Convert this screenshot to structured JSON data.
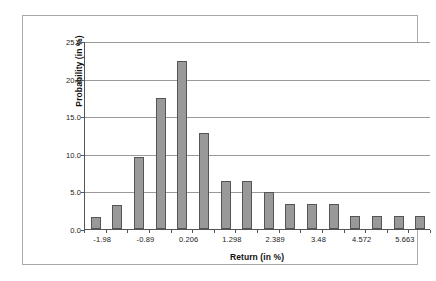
{
  "chart_data": {
    "type": "bar",
    "title": "",
    "subtitle": "",
    "xlabel": "Return (in %)",
    "ylabel": "Probability (in %)",
    "ylim": [
      0.0,
      25.0
    ],
    "y_ticks": [
      "0.0",
      "5.0",
      "10.0",
      "15.0",
      "20.0",
      "25.0"
    ],
    "y_tick_values": [
      0.0,
      5.0,
      10.0,
      15.0,
      20.0,
      25.0
    ],
    "grid": "horizontal",
    "legend": "none",
    "bar_color": "#999999",
    "bar_edge_color": "#555555",
    "gridline_color": "#9a9a9a",
    "axis_color": "#555555",
    "frame_color": "#a8a8a8",
    "bin_labels": [
      "-1.98",
      "-0.89",
      "0.206",
      "1.298",
      "2.389",
      "3.48",
      "4.572",
      "5.663"
    ],
    "bin_label_positions": [
      1,
      4,
      7,
      10,
      13,
      16,
      19,
      22
    ],
    "categories": [
      "-2.525",
      "-2.253",
      "-1.98",
      "-1.707",
      "-1.435",
      "-1.162",
      "-0.89",
      "-0.617",
      "-0.344",
      "-0.072",
      "0.206",
      "0.479",
      "0.752",
      "1.025",
      "1.298",
      "1.571",
      "1.843",
      "2.116",
      "2.389",
      "2.662",
      "2.935",
      "3.207",
      "3.48",
      "3.753",
      "4.026",
      "4.299",
      "4.572"
    ],
    "values": [
      0,
      0,
      1.6,
      0,
      3.2,
      0,
      9.6,
      0,
      17.4,
      22.3,
      12.8,
      0,
      6.4,
      0,
      6.4,
      0,
      4.9,
      0,
      3.3,
      0,
      3.3,
      0,
      3.3,
      0,
      1.7,
      1.7,
      1.7
    ],
    "bars": [
      {
        "index": 0,
        "value": 1.6,
        "slot": 0
      },
      {
        "index": 1,
        "value": 3.2,
        "slot": 1
      },
      {
        "index": 2,
        "value": 9.6,
        "slot": 2
      },
      {
        "index": 3,
        "value": 17.4,
        "slot": 3
      },
      {
        "index": 4,
        "value": 22.3,
        "slot": 4
      },
      {
        "index": 5,
        "value": 12.8,
        "slot": 5
      },
      {
        "index": 6,
        "value": 6.4,
        "slot": 6
      },
      {
        "index": 7,
        "value": 6.4,
        "slot": 7
      },
      {
        "index": 8,
        "value": 4.9,
        "slot": 8
      },
      {
        "index": 9,
        "value": 3.3,
        "slot": 9
      },
      {
        "index": 10,
        "value": 3.3,
        "slot": 10
      },
      {
        "index": 11,
        "value": 3.3,
        "slot": 11
      },
      {
        "index": 12,
        "value": 1.7,
        "slot": 12
      },
      {
        "index": 13,
        "value": 1.7,
        "slot": 13
      },
      {
        "index": 14,
        "value": 1.7,
        "slot": 14
      },
      {
        "index": 15,
        "value": 1.7,
        "slot": 15
      }
    ],
    "n_bars": 16
  }
}
